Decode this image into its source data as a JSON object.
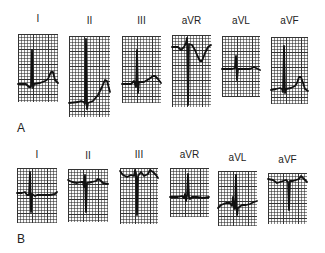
{
  "panels": [
    {
      "label": "A",
      "leads": [
        {
          "label": "I",
          "box": [
            18,
            34,
            40,
            68
          ],
          "label_y": 14,
          "trace": "M0,50 L8,50 L11,53 L13,53 L14,16 L15,54 L16,50 L22,49 L27,47 L30,45 L33,38 L35,38 L37,46 L40,49"
        },
        {
          "label": "II",
          "box": [
            69,
            36,
            41,
            81
          ],
          "label_y": 16,
          "trace": "M0,67 L9,66 L12,65 L15,66 L16,68 L17,3 L18,73 L19,67 L24,65 L29,59 L33,51 L36,44 L38,45 L41,56"
        },
        {
          "label": "III",
          "box": [
            122,
            36,
            39,
            67
          ],
          "label_y": 16,
          "trace": "M0,48 L9,48 L12,45 L14,51 L15,14 L16,57 L17,46 L22,46 L27,43 L31,40 L33,40 L36,43 L39,47"
        },
        {
          "label": "aVR",
          "box": [
            172,
            35,
            39,
            72
          ],
          "label_y": 16,
          "trace": "M0,12 L6,12 L9,15 L12,12 L14,8 L15,3 L16,70 L17,9 L20,10 L23,15 L25,20 L28,26 L30,26 L33,18 L36,12 L39,10"
        },
        {
          "label": "aVL",
          "box": [
            222,
            36,
            38,
            61
          ],
          "label_y": 16,
          "trace": "M0,33 L10,33 L13,32 L14,20 L15,44 L16,33 L22,33 L28,33 L32,31 L34,32 L38,34"
        },
        {
          "label": "aVF",
          "box": [
            271,
            37,
            37,
            67
          ],
          "label_y": 16,
          "trace": "M0,53 L5,52 L9,51 L11,52 L12,55 L13,9 L14,56 L15,52 L20,51 L24,49 L26,46 L28,40 L30,40 L32,46 L34,52 L37,54"
        }
      ]
    },
    {
      "label": "B",
      "leads": [
        {
          "label": "I",
          "box": [
            17,
            168,
            40,
            55
          ],
          "label_y": 150,
          "trace": "M0,25 L5,25 L8,24 L10,27 L12,27 L13,4 L14,44 L15,26 L18,28 L20,27 L26,27 L33,27 L38,26 L40,24"
        },
        {
          "label": "II",
          "box": [
            68,
            169,
            40,
            53
          ],
          "label_y": 151,
          "trace": "M0,11 L4,13 L9,14 L13,13 L15,13 L16,18 L17,6 L18,43 L19,14 L24,13 L28,12 L30,10 L32,11 L35,14 L40,15"
        },
        {
          "label": "III",
          "box": [
            120,
            168,
            38,
            56
          ],
          "label_y": 150,
          "trace": "M0,3 L3,7 L7,9 L11,7 L14,8 L15,2 L16,5 L17,47 L18,8 L21,4 L24,8 L28,6 L30,2 L33,4 L36,7 L38,10"
        },
        {
          "label": "aVR",
          "box": [
            170,
            168,
            39,
            49
          ],
          "label_y": 150,
          "trace": "M0,29 L8,29 L12,28 L14,30 L15,26 L16,33 L17,28 L18,6 L19,29 L20,31 L22,29 L27,29 L33,30 L39,29"
        },
        {
          "label": "aVL",
          "box": [
            218,
            171,
            39,
            55
          ],
          "label_y": 153,
          "trace": "M0,37 L3,34 L8,32 L12,32 L14,35 L15,26 L16,36 L17,38 L18,4 L19,44 L20,37 L24,34 L28,34 L32,33 L36,31 L39,30"
        },
        {
          "label": "aVF",
          "box": [
            268,
            173,
            39,
            51
          ],
          "label_y": 155,
          "trace": "M0,6 L5,7 L9,10 L12,9 L15,8 L18,7 L20,9 L21,37 L22,8 L25,8 L28,7 L31,6 L33,3 L35,5 L39,9"
        }
      ]
    }
  ],
  "panel_label_positions": {
    "A": [
      17,
      122
    ],
    "B": [
      17,
      233
    ]
  }
}
